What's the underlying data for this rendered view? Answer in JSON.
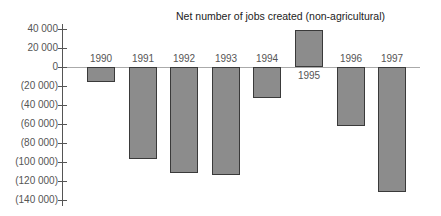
{
  "chart_data": {
    "type": "bar",
    "title": "Net number of jobs created (non-agricultural)",
    "xlabel": "",
    "ylabel": "",
    "categories": [
      "1990",
      "1991",
      "1992",
      "1993",
      "1994",
      "1995",
      "1996",
      "1997"
    ],
    "values": [
      -16000,
      -97000,
      -112000,
      -114000,
      -33000,
      39000,
      -62000,
      -132000
    ],
    "ylim": [
      -140000,
      40000
    ],
    "yticks": [
      40000,
      20000,
      0,
      -20000,
      -40000,
      -60000,
      -80000,
      -100000,
      -120000,
      -140000
    ],
    "ytick_labels": [
      "40 000",
      "20 000",
      "0",
      "(20 000)",
      "(40 000)",
      "(60 000)",
      "(80 000)",
      "(100 000)",
      "(120 000)",
      "(140 000)"
    ],
    "grid": false,
    "legend": null,
    "bar_color": "#8c8c8c",
    "bar_edge_color": "#3a3a3a"
  }
}
